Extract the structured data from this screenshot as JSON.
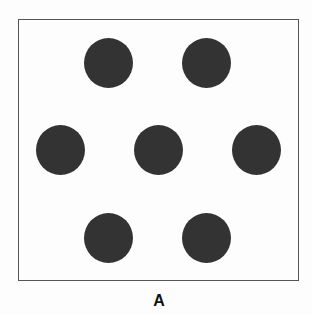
{
  "figure": {
    "label": "A",
    "frame_color": "#555555",
    "dot_color": "#333333",
    "background": "#fdfdfd",
    "dot_count": 7,
    "dots": [
      {
        "id": "top-left",
        "cx": 109,
        "cy": 63
      },
      {
        "id": "top-right",
        "cx": 207,
        "cy": 63
      },
      {
        "id": "middle-left",
        "cx": 60,
        "cy": 150
      },
      {
        "id": "middle-center",
        "cx": 158,
        "cy": 150
      },
      {
        "id": "middle-right",
        "cx": 256,
        "cy": 150
      },
      {
        "id": "bottom-left",
        "cx": 109,
        "cy": 238
      },
      {
        "id": "bottom-right",
        "cx": 207,
        "cy": 238
      }
    ]
  }
}
